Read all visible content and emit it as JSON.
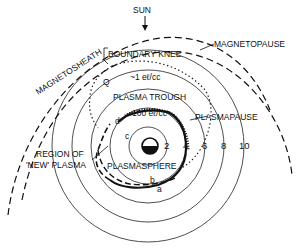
{
  "diagram": {
    "labels": {
      "sun": "SUN",
      "magnetosheath": "MAGNETOSHEATH",
      "magnetopause": "MAGNETOPAUSE",
      "boundary_knee": "BOUNDARY KNEE",
      "density_trough": "~1 eℓ/cc",
      "plasma_trough": "PLASMA TROUGH",
      "plasmapause": "PLASMAPAUSE",
      "density_sphere": "100 eℓ/cc",
      "plasmasphere": "PLASMASPHERE",
      "region_line1": "REGION OF",
      "region_line2": "'NEW' PLASMA",
      "point_q": "Q",
      "point_a": "a",
      "point_b": "b",
      "point_c": "c",
      "point_d": "d"
    },
    "radial_ticks": [
      "2",
      "4",
      "6",
      "8",
      "10"
    ],
    "colors": {
      "ink": "#111111",
      "background": "#ffffff"
    }
  }
}
